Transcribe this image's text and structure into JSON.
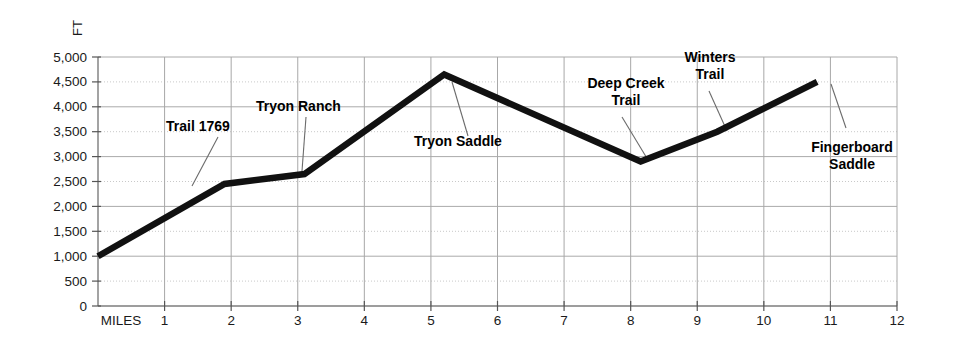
{
  "chart_data": {
    "type": "line",
    "title": "",
    "subtitle": "",
    "xlabel": "MILES",
    "ylabel": "FT",
    "xlim": [
      0,
      12
    ],
    "ylim": [
      0,
      5000
    ],
    "grid": true,
    "legend": "none",
    "x_ticks": [
      "1",
      "2",
      "3",
      "4",
      "5",
      "6",
      "7",
      "8",
      "9",
      "10",
      "11",
      "12"
    ],
    "x_tick_values": [
      1,
      2,
      3,
      4,
      5,
      6,
      7,
      8,
      9,
      10,
      11,
      12
    ],
    "y_ticks": [
      "0",
      "500",
      "1,000",
      "1,500",
      "2,000",
      "2,500",
      "3,000",
      "3,500",
      "4,000",
      "4,500",
      "5,000"
    ],
    "y_tick_values": [
      0,
      500,
      1000,
      1500,
      2000,
      2500,
      3000,
      3500,
      4000,
      4500,
      5000
    ],
    "series": [
      {
        "name": "Elevation profile",
        "color": "#111111",
        "x": [
          0,
          1.9,
          3.1,
          5.2,
          8.15,
          9.3,
          10.8
        ],
        "values": [
          1000,
          2450,
          2650,
          4650,
          2900,
          3500,
          4500
        ]
      }
    ],
    "annotations": [
      {
        "label": "Trail 1769",
        "lines": [
          "Trail 1769"
        ],
        "mile": 1.9,
        "elevation": 2450,
        "text_x": 166,
        "text_y": 131,
        "text_anchor": "start",
        "leader": {
          "x1": 218,
          "y1": 137,
          "x2": 192,
          "y2": 186
        }
      },
      {
        "label": "Tryon Ranch",
        "lines": [
          "Tryon Ranch"
        ],
        "mile": 3.1,
        "elevation": 2650,
        "text_x": 256,
        "text_y": 111,
        "text_anchor": "start",
        "leader": {
          "x1": 306,
          "y1": 117,
          "x2": 302,
          "y2": 171
        }
      },
      {
        "label": "Tryon Saddle",
        "lines": [
          "Tryon Saddle"
        ],
        "mile": 5.2,
        "elevation": 4650,
        "text_x": 414,
        "text_y": 146,
        "text_anchor": "start",
        "leader": {
          "x1": 452,
          "y1": 82,
          "x2": 468,
          "y2": 136
        }
      },
      {
        "label": "Deep Creek Trail",
        "lines": [
          "Deep Creek",
          "Trail"
        ],
        "mile": 8.15,
        "elevation": 2900,
        "text_x": 626,
        "text_y": 88,
        "text_anchor": "middle",
        "leader": {
          "x1": 622,
          "y1": 117,
          "x2": 648,
          "y2": 160
        }
      },
      {
        "label": "Winters Trail",
        "lines": [
          "Winters",
          "Trail"
        ],
        "mile": 9.3,
        "elevation": 3500,
        "text_x": 710,
        "text_y": 62,
        "text_anchor": "middle",
        "leader": {
          "x1": 709,
          "y1": 91,
          "x2": 727,
          "y2": 131
        }
      },
      {
        "label": "Fingerboard Saddle",
        "lines": [
          "Fingerboard",
          "Saddle"
        ],
        "mile": 10.8,
        "elevation": 4500,
        "text_x": 852,
        "text_y": 152,
        "text_anchor": "middle",
        "leader": {
          "x1": 831,
          "y1": 84,
          "x2": 846,
          "y2": 128
        }
      }
    ]
  }
}
